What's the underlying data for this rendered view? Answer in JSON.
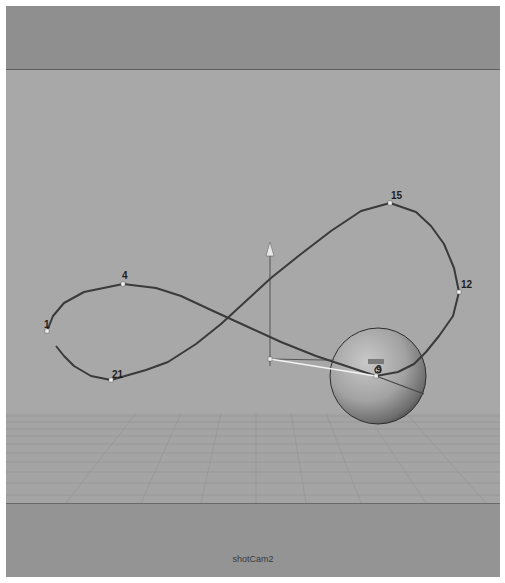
{
  "viewport": {
    "camera_name": "shotCam2",
    "colors": {
      "sky": "#8f8f8f",
      "background": "#a8a8a8",
      "ground": "#a4a4a4",
      "floor": "#949494",
      "curve": "#3a3a3a",
      "grid": "#8c8c8c",
      "vertex": "#f0f0f0"
    }
  },
  "motion_path": {
    "type": "figure-eight-curve",
    "labeled_points": [
      {
        "label": "1",
        "x": 41,
        "y": 325
      },
      {
        "label": "4",
        "x": 117,
        "y": 278
      },
      {
        "label": "15",
        "x": 384,
        "y": 197
      },
      {
        "label": "12",
        "x": 453,
        "y": 286
      },
      {
        "label": "9",
        "x": 370,
        "y": 370
      },
      {
        "label": "21",
        "x": 105,
        "y": 374
      }
    ]
  },
  "objects": {
    "sphere": {
      "name": "sphere",
      "cx": 372,
      "cy": 370,
      "r": 48
    },
    "locator": {
      "name": "locator",
      "x": 264,
      "y": 353
    }
  }
}
